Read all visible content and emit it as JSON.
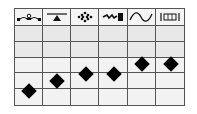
{
  "table": {
    "columns": [
      {
        "icon": "wave-breaker-icon",
        "label": ""
      },
      {
        "icon": "seesaw-triangle-icon",
        "label": ""
      },
      {
        "icon": "dotted-cluster-icon",
        "label": ""
      },
      {
        "icon": "drill-bit-icon",
        "label": ""
      },
      {
        "icon": "sine-wave-icon",
        "label": ""
      },
      {
        "icon": "bracket-frame-icon",
        "label": ""
      }
    ],
    "body_rows": 5
  },
  "markers": [
    {
      "column": 0,
      "level": 1.0,
      "shape": "diamond"
    },
    {
      "column": 1,
      "level": 1.6,
      "shape": "diamond"
    },
    {
      "column": 2,
      "level": 2.0,
      "shape": "diamond"
    },
    {
      "column": 3,
      "level": 2.0,
      "shape": "diamond"
    },
    {
      "column": 4,
      "level": 2.6,
      "shape": "diamond"
    },
    {
      "column": 5,
      "level": 2.6,
      "shape": "diamond"
    }
  ],
  "colors": {
    "grid_line": "#555555",
    "marker": "#000000",
    "upper_rows": "#e8e8e8",
    "lower_rows": "#f2f2f2"
  }
}
